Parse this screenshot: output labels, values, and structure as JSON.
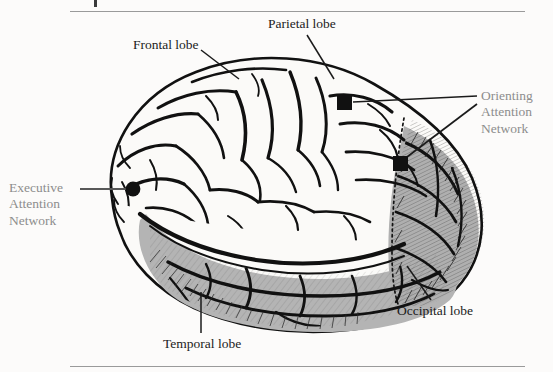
{
  "figure": {
    "background_color": "#fcfbfa",
    "rule_color": "#9a9a9a",
    "width": 553,
    "height": 372
  },
  "labels": {
    "frontal_lobe": "Frontal lobe",
    "parietal_lobe": "Parietal lobe",
    "temporal_lobe": "Temporal lobe",
    "occipital_lobe": "Occipital lobe",
    "executive_network": {
      "line1": "Executive",
      "line2": "Attention",
      "line3": "Network"
    },
    "orienting_network": {
      "line1": "Orienting",
      "line2": "Attention",
      "line3": "Network"
    }
  },
  "colors": {
    "lobe_label_text": "#1b1b1b",
    "network_label_text": "#8d8d8d",
    "leader_line_dark": "#1b1b1b",
    "leader_line_gray": "#6f6f6f",
    "marker_fill": "#111111",
    "brain_outline": "#111111",
    "brain_upper_fill": "#fbfaf8",
    "brain_lower_fill": "#b4b4b4",
    "brain_occipital_fill": "#b0b0b0"
  },
  "markers": {
    "executive_site": {
      "shape": "filled-circle",
      "x": 133,
      "y": 189,
      "radius": 7
    },
    "orienting_site_superior": {
      "shape": "filled-square",
      "x": 337,
      "y": 95,
      "size": 15
    },
    "orienting_site_posterior": {
      "shape": "filled-square",
      "x": 393,
      "y": 156,
      "size": 15
    }
  },
  "leader_lines": [
    {
      "name": "frontal-lobe-leader",
      "from": [
        201,
        50
      ],
      "to": [
        238,
        78
      ]
    },
    {
      "name": "parietal-lobe-leader",
      "from": [
        307,
        34
      ],
      "to": [
        333,
        77
      ]
    },
    {
      "name": "temporal-lobe-leader",
      "from": [
        201,
        333
      ],
      "to": [
        201,
        293
      ]
    },
    {
      "name": "occipital-lobe-leader",
      "from": [
        430,
        300
      ],
      "to": [
        408,
        267
      ]
    },
    {
      "name": "executive-network-leader",
      "from": [
        80,
        189
      ],
      "to": [
        128,
        189
      ]
    },
    {
      "name": "orienting-superior-leader",
      "from": [
        352,
        102
      ],
      "to": [
        476,
        97
      ]
    },
    {
      "name": "orienting-posterior-leader",
      "from": [
        402,
        160
      ],
      "to": [
        476,
        104
      ]
    }
  ]
}
